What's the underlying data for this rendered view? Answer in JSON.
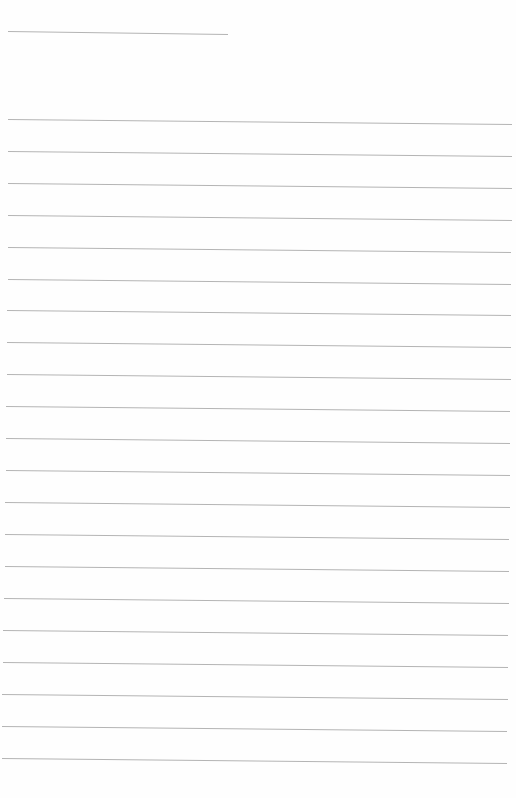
{
  "document": {
    "type": "lined-paper",
    "width": 516,
    "height": 798,
    "background": "#fefefe",
    "line_color": "#b4b4b4",
    "line_width": 1,
    "header_line": {
      "x1": 8,
      "y1": 31,
      "x2": 228,
      "y2": 34
    },
    "ruled_lines": [
      {
        "x1": 8,
        "y1": 119,
        "x2": 512,
        "y2": 124
      },
      {
        "x1": 8,
        "y1": 151,
        "x2": 512,
        "y2": 156
      },
      {
        "x1": 8,
        "y1": 183,
        "x2": 512,
        "y2": 188
      },
      {
        "x1": 8,
        "y1": 215,
        "x2": 512,
        "y2": 220
      },
      {
        "x1": 8,
        "y1": 247,
        "x2": 511,
        "y2": 252
      },
      {
        "x1": 8,
        "y1": 279,
        "x2": 511,
        "y2": 284
      },
      {
        "x1": 7,
        "y1": 310,
        "x2": 511,
        "y2": 315
      },
      {
        "x1": 7,
        "y1": 342,
        "x2": 511,
        "y2": 347
      },
      {
        "x1": 7,
        "y1": 374,
        "x2": 511,
        "y2": 379
      },
      {
        "x1": 6,
        "y1": 406,
        "x2": 510,
        "y2": 411
      },
      {
        "x1": 6,
        "y1": 438,
        "x2": 510,
        "y2": 443
      },
      {
        "x1": 6,
        "y1": 470,
        "x2": 510,
        "y2": 475
      },
      {
        "x1": 5,
        "y1": 502,
        "x2": 510,
        "y2": 507
      },
      {
        "x1": 5,
        "y1": 534,
        "x2": 509,
        "y2": 539
      },
      {
        "x1": 5,
        "y1": 566,
        "x2": 509,
        "y2": 571
      },
      {
        "x1": 4,
        "y1": 598,
        "x2": 509,
        "y2": 603
      },
      {
        "x1": 3,
        "y1": 630,
        "x2": 508,
        "y2": 635
      },
      {
        "x1": 3,
        "y1": 662,
        "x2": 508,
        "y2": 667
      },
      {
        "x1": 2,
        "y1": 694,
        "x2": 508,
        "y2": 699
      },
      {
        "x1": 2,
        "y1": 726,
        "x2": 507,
        "y2": 731
      },
      {
        "x1": 2,
        "y1": 758,
        "x2": 507,
        "y2": 763
      }
    ]
  }
}
